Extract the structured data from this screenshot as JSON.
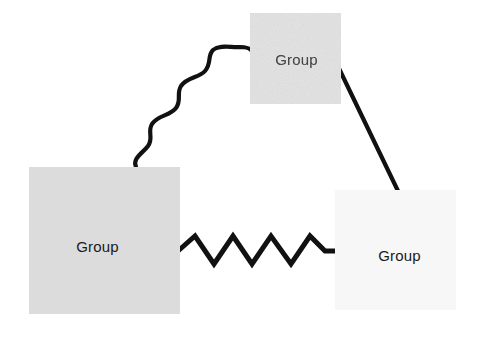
{
  "diagram": {
    "background_color": "#ffffff",
    "nodes": [
      {
        "id": "node-top",
        "label": "Group",
        "shape": "rectangle",
        "fill_color": "#e3e3e3",
        "text_color": "#1a1a1a",
        "x": 250,
        "y": 13,
        "width": 91,
        "height": 91
      },
      {
        "id": "node-left",
        "label": "Group",
        "shape": "rectangle",
        "fill_color": "#dcdcdc",
        "text_color": "#1a1a1a",
        "x": 29,
        "y": 167,
        "width": 151,
        "height": 147
      },
      {
        "id": "node-right",
        "label": "Group",
        "shape": "rectangle",
        "fill_color": "#f7f7f7",
        "text_color": "#1a1a1a",
        "x": 335,
        "y": 190,
        "width": 121,
        "height": 120
      }
    ],
    "connectors": [
      {
        "id": "connector-wavy",
        "style": "wavy",
        "from": "node-left",
        "to": "node-top",
        "stroke_color": "#111111",
        "stroke_width": 4
      },
      {
        "id": "connector-straight",
        "style": "straight",
        "from": "node-top",
        "to": "node-right",
        "stroke_color": "#111111",
        "stroke_width": 4
      },
      {
        "id": "connector-zigzag",
        "style": "zigzag",
        "from": "node-left",
        "to": "node-right",
        "stroke_color": "#111111",
        "stroke_width": 5
      }
    ]
  }
}
